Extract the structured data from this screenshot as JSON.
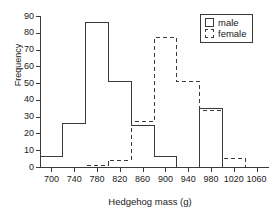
{
  "chart_data": {
    "type": "bar",
    "title": "",
    "xlabel": "Hedgehog mass (g)",
    "ylabel": "Frequency",
    "xlim": [
      680,
      1080
    ],
    "ylim": [
      0,
      90
    ],
    "bin_width": 40,
    "grid": false,
    "legend_position": "top-right",
    "xticks": [
      700,
      740,
      780,
      820,
      860,
      900,
      940,
      980,
      1020,
      1060
    ],
    "yticks": [
      0,
      10,
      20,
      30,
      40,
      50,
      60,
      70,
      80,
      90
    ],
    "bin_edges": [
      680,
      720,
      760,
      800,
      840,
      880,
      920,
      960,
      1000,
      1040,
      1080
    ],
    "categories": [
      "680-720",
      "720-760",
      "760-800",
      "800-840",
      "840-880",
      "880-920",
      "920-960",
      "960-1000",
      "1000-1040",
      "1040-1080"
    ],
    "series": [
      {
        "name": "male",
        "style": "solid",
        "values": [
          6,
          26,
          86,
          51,
          25,
          6,
          0,
          35,
          0,
          0
        ]
      },
      {
        "name": "female",
        "style": "dashed",
        "values": [
          0,
          0,
          1,
          4,
          27,
          77,
          51,
          34,
          5,
          0
        ]
      }
    ]
  },
  "legend": {
    "items": [
      {
        "label": "male",
        "swatch": "solid-square-icon"
      },
      {
        "label": "female",
        "swatch": "dashed-square-icon"
      }
    ]
  },
  "axes": {
    "y_title": "Frequency",
    "x_title": "Hedgehog mass (g)",
    "y_tick_labels": [
      "0",
      "10",
      "20",
      "30",
      "40",
      "50",
      "60",
      "70",
      "80",
      "90"
    ],
    "x_tick_labels": [
      "700",
      "740",
      "780",
      "820",
      "860",
      "900",
      "940",
      "980",
      "1020",
      "1060"
    ]
  }
}
